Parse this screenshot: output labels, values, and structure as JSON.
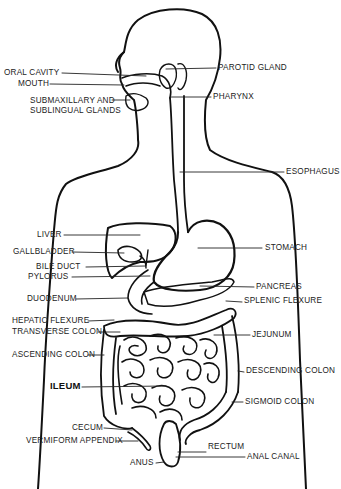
{
  "diagram": {
    "stroke_color": "#111111",
    "background": "#ffffff",
    "labels_left": [
      {
        "id": "oral-cavity",
        "text": "ORAL CAVITY",
        "x": 4,
        "y": 69
      },
      {
        "id": "mouth",
        "text": "MOUTH",
        "x": 18,
        "y": 80
      },
      {
        "id": "submaxillary",
        "text": "SUBMAXILLARY AND",
        "x": 30,
        "y": 97
      },
      {
        "id": "sublingual",
        "text": "SUBLINGUAL GLANDS",
        "x": 30,
        "y": 107
      },
      {
        "id": "liver",
        "text": "LIVER",
        "x": 37,
        "y": 231
      },
      {
        "id": "gallbladder",
        "text": "GALLBLADDER",
        "x": 13,
        "y": 248
      },
      {
        "id": "bile-duct",
        "text": "BILE DUCT",
        "x": 36,
        "y": 263
      },
      {
        "id": "pylorus",
        "text": "PYLORUS",
        "x": 28,
        "y": 273
      },
      {
        "id": "duodenum",
        "text": "DUODENUM",
        "x": 27,
        "y": 295
      },
      {
        "id": "hepatic-flexure",
        "text": "HEPATIC FLEXURE",
        "x": 12,
        "y": 317
      },
      {
        "id": "transverse-colon",
        "text": "TRANSVERSE COLON",
        "x": 12,
        "y": 328
      },
      {
        "id": "ascending-colon",
        "text": "ASCENDING COLON",
        "x": 12,
        "y": 351
      },
      {
        "id": "ileum",
        "text": "ILEUM",
        "x": 50,
        "y": 383,
        "bold": true
      },
      {
        "id": "cecum",
        "text": "CECUM",
        "x": 72,
        "y": 424
      },
      {
        "id": "vermiform-appendix",
        "text": "VERMIFORM APPENDIX",
        "x": 26,
        "y": 437
      },
      {
        "id": "anus",
        "text": "ANUS",
        "x": 130,
        "y": 459
      }
    ],
    "labels_right": [
      {
        "id": "parotid-gland",
        "text": "PAROTID GLAND",
        "x": 218,
        "y": 64
      },
      {
        "id": "pharynx",
        "text": "PHARYNX",
        "x": 213,
        "y": 93
      },
      {
        "id": "esophagus",
        "text": "ESOPHAGUS",
        "x": 286,
        "y": 168
      },
      {
        "id": "stomach",
        "text": "STOMACH",
        "x": 265,
        "y": 244
      },
      {
        "id": "pancreas",
        "text": "PANCREAS",
        "x": 256,
        "y": 283
      },
      {
        "id": "splenic-flexure",
        "text": "SPLENIC FLEXURE",
        "x": 244,
        "y": 297
      },
      {
        "id": "jejunum",
        "text": "JEJUNUM",
        "x": 252,
        "y": 331
      },
      {
        "id": "descending-colon",
        "text": "DESCENDING COLON",
        "x": 246,
        "y": 367
      },
      {
        "id": "sigmoid-colon",
        "text": "SIGMOID COLON",
        "x": 245,
        "y": 398
      },
      {
        "id": "rectum",
        "text": "RECTUM",
        "x": 208,
        "y": 443
      },
      {
        "id": "anal-canal",
        "text": "ANAL CANAL",
        "x": 247,
        "y": 449
      }
    ]
  }
}
